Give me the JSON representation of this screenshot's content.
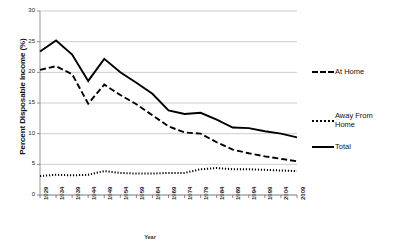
{
  "chart_data": {
    "type": "line",
    "title": "",
    "xlabel": "Year",
    "ylabel": "Percent Disposable Income (%)",
    "ylim": [
      0,
      30
    ],
    "yticks": [
      0,
      5,
      10,
      15,
      20,
      25,
      30
    ],
    "grid": true,
    "legend_position": "right",
    "categories": [
      "1929",
      "1934",
      "1939",
      "1944",
      "1949",
      "1954",
      "1959",
      "1964",
      "1969",
      "1974",
      "1979",
      "1984",
      "1989",
      "1994",
      "1999",
      "2004",
      "2009"
    ],
    "series": [
      {
        "name": "At Home",
        "style": "dashed",
        "color": "#000000",
        "values": [
          20.4,
          21.0,
          19.7,
          14.9,
          18.0,
          16.3,
          14.8,
          13.0,
          11.2,
          10.2,
          10.0,
          8.6,
          7.4,
          6.8,
          6.3,
          5.9,
          5.5
        ]
      },
      {
        "name": "Away From Home",
        "style": "dotted",
        "color": "#000000",
        "values": [
          3.1,
          3.3,
          3.2,
          3.3,
          3.9,
          3.6,
          3.5,
          3.5,
          3.6,
          3.6,
          4.2,
          4.4,
          4.2,
          4.2,
          4.1,
          4.0,
          3.9
        ]
      },
      {
        "name": "Total",
        "style": "solid",
        "color": "#000000",
        "values": [
          23.4,
          25.2,
          22.9,
          18.6,
          22.2,
          20.0,
          18.3,
          16.5,
          13.8,
          13.2,
          13.4,
          12.3,
          11.0,
          10.9,
          10.4,
          10.0,
          9.4
        ]
      }
    ]
  },
  "legend": {
    "items": [
      {
        "label": "At Home"
      },
      {
        "label": "Away From Home"
      },
      {
        "label": "Total"
      }
    ]
  },
  "axes": {
    "x_title": "Year",
    "y_title": "Percent Disposable Income (%)"
  }
}
